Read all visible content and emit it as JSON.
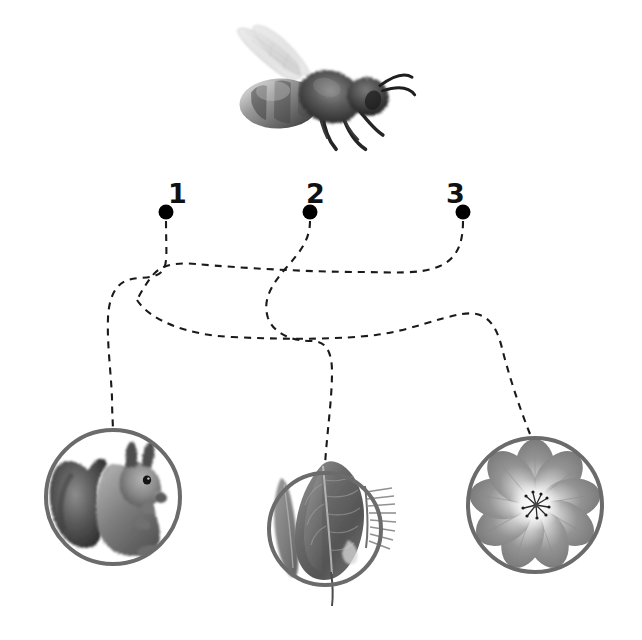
{
  "diagram": {
    "background_color": "#ffffff",
    "stroke_color": "#6b6b6b",
    "dash_color": "#1a1a1a",
    "dot_color": "#000000",
    "subject": {
      "name": "honey-bee",
      "caption": "Honey bee",
      "photo_style": "grayscale photograph",
      "position": {
        "x": 318,
        "y": 95
      },
      "size": {
        "width": 190,
        "height": 125
      }
    },
    "nodes": [
      {
        "id": "node-1",
        "label": "1",
        "label_position": {
          "x": 176,
          "y": 194
        },
        "dot_position": {
          "x": 166,
          "y": 212
        },
        "dot_radius": 7,
        "connects_to": "flower-circle"
      },
      {
        "id": "node-2",
        "label": "2",
        "label_position": {
          "x": 314,
          "y": 194
        },
        "dot_position": {
          "x": 310,
          "y": 212
        },
        "dot_radius": 7,
        "connects_to": "leaf-circle"
      },
      {
        "id": "node-3",
        "label": "3",
        "label_position": {
          "x": 454,
          "y": 194
        },
        "dot_position": {
          "x": 463,
          "y": 212
        },
        "dot_radius": 7,
        "connects_to": "squirrel-circle"
      }
    ],
    "targets": [
      {
        "id": "squirrel-circle",
        "name": "squirrel",
        "caption": "Squirrel",
        "photo_style": "grayscale photograph",
        "center": {
          "x": 113,
          "y": 497
        },
        "radius": 68,
        "ring_width": 4
      },
      {
        "id": "leaf-circle",
        "name": "leaf",
        "caption": "Leaf",
        "photo_style": "grayscale photograph",
        "center": {
          "x": 325,
          "y": 529
        },
        "radius": 57,
        "ring_width": 4
      },
      {
        "id": "flower-circle",
        "name": "flower",
        "caption": "Flower",
        "photo_style": "grayscale photograph",
        "center": {
          "x": 535,
          "y": 505
        },
        "radius": 68,
        "ring_width": 4
      }
    ],
    "paths": [
      {
        "id": "path-1",
        "from": "node-1",
        "to": "squirrel-circle",
        "style": "dashed",
        "dash_pattern": "7 6"
      },
      {
        "id": "path-2",
        "from": "node-2",
        "to": "leaf-circle",
        "style": "dashed",
        "dash_pattern": "7 6"
      },
      {
        "id": "path-3",
        "from": "node-3",
        "to": "flower-circle",
        "style": "dashed",
        "dash_pattern": "7 6"
      }
    ]
  }
}
